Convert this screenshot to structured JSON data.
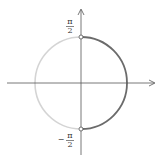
{
  "diagram": {
    "type": "unit-circle-range",
    "labels": {
      "top_num": "π",
      "top_den": "2",
      "bottom_sign": "−",
      "bottom_num": "π",
      "bottom_den": "2"
    },
    "colors": {
      "axis": "#555555",
      "right_arc": "#6b6b6b",
      "left_arc": "#d4d4d4",
      "label": "#333333"
    }
  }
}
